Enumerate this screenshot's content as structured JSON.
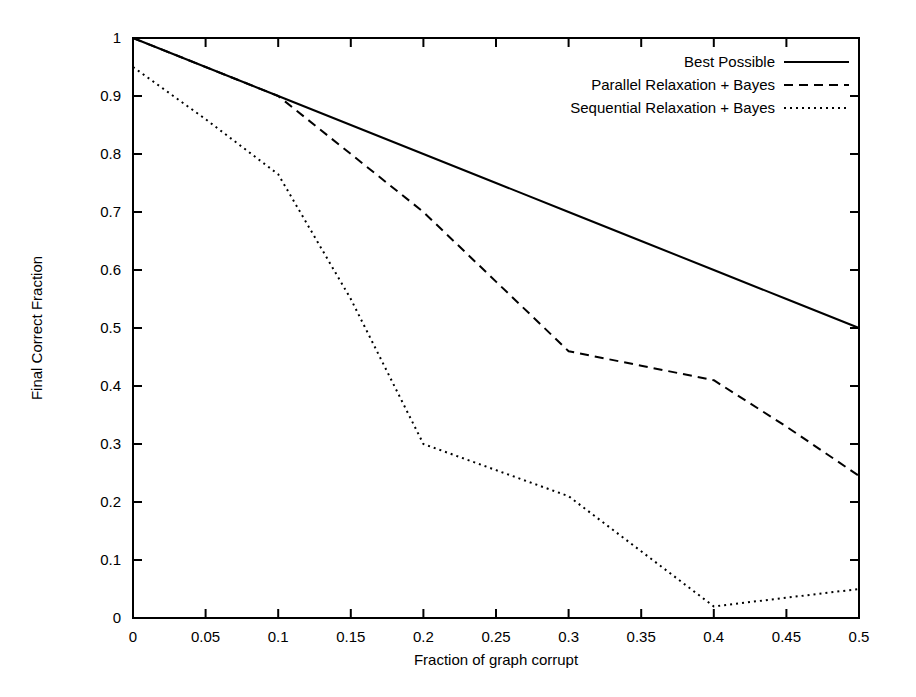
{
  "chart_data": {
    "type": "line",
    "title": "",
    "xlabel": "Fraction of graph corrupt",
    "ylabel": "Final Correct Fraction",
    "xlim": [
      0,
      0.5
    ],
    "ylim": [
      0,
      1
    ],
    "grid": false,
    "legend_position": "top-right",
    "xticks": [
      0,
      0.05,
      0.1,
      0.15,
      0.2,
      0.25,
      0.3,
      0.35,
      0.4,
      0.45,
      0.5
    ],
    "xticklabels": [
      "0",
      "0.05",
      "0.1",
      "0.15",
      "0.2",
      "0.25",
      "0.3",
      "0.35",
      "0.4",
      "0.45",
      "0.5"
    ],
    "yticks": [
      0,
      0.1,
      0.2,
      0.3,
      0.4,
      0.5,
      0.6,
      0.7,
      0.8,
      0.9,
      1
    ],
    "yticklabels": [
      "0",
      "0.1",
      "0.2",
      "0.3",
      "0.4",
      "0.5",
      "0.6",
      "0.7",
      "0.8",
      "0.9",
      "1"
    ],
    "series": [
      {
        "name": "Best Possible",
        "style": "solid",
        "color": "#000000",
        "x": [
          0,
          0.05,
          0.1,
          0.15,
          0.2,
          0.25,
          0.3,
          0.35,
          0.4,
          0.45,
          0.5
        ],
        "values": [
          1.0,
          0.95,
          0.9,
          0.85,
          0.8,
          0.75,
          0.7,
          0.65,
          0.6,
          0.55,
          0.5
        ]
      },
      {
        "name": "Parallel Relaxation + Bayes",
        "style": "dashed",
        "color": "#000000",
        "x": [
          0,
          0.05,
          0.1,
          0.15,
          0.2,
          0.25,
          0.3,
          0.35,
          0.4,
          0.45,
          0.5
        ],
        "values": [
          1.0,
          0.95,
          0.9,
          0.8,
          0.7,
          0.58,
          0.46,
          0.435,
          0.41,
          0.33,
          0.245
        ]
      },
      {
        "name": "Sequential Relaxation + Bayes",
        "style": "dotted",
        "color": "#000000",
        "x": [
          0,
          0.05,
          0.1,
          0.15,
          0.2,
          0.25,
          0.3,
          0.35,
          0.4,
          0.45,
          0.5
        ],
        "values": [
          0.95,
          0.86,
          0.765,
          0.55,
          0.3,
          0.255,
          0.21,
          0.115,
          0.02,
          0.035,
          0.05
        ]
      }
    ]
  },
  "legend": {
    "entries": [
      {
        "label": "Best Possible",
        "style": "solid"
      },
      {
        "label": "Parallel Relaxation + Bayes",
        "style": "dashed"
      },
      {
        "label": "Sequential Relaxation + Bayes",
        "style": "dotted"
      }
    ]
  }
}
